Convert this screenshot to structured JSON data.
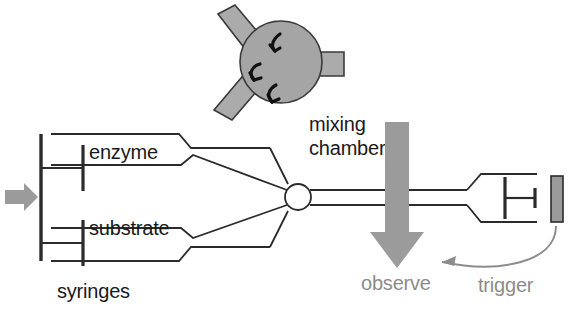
{
  "diagram": {
    "labels": {
      "enzyme": "enzyme",
      "substrate": "substrate",
      "syringes": "syringes",
      "mixing_line1": "mixing",
      "mixing_line2": "chamber",
      "observe": "observe",
      "trigger": "trigger"
    },
    "icons": {
      "drive_arrow": "drive-arrow-icon",
      "observe_arrow": "observe-arrow-icon",
      "trigger_arrow": "trigger-curved-arrow-icon",
      "swirl": "mixing-swirl-icon",
      "stop_block": "stop-block-icon"
    },
    "colors": {
      "line": "#2b2b2b",
      "gray_fill": "#9b9b9b",
      "chamber_fill": "#a5a5a5",
      "gray_text": "#8c8c8c",
      "dark_text": "#1a1a1a",
      "background": "#ffffff"
    },
    "parts": [
      {
        "name": "enzyme-syringe",
        "label": "enzyme"
      },
      {
        "name": "substrate-syringe",
        "label": "substrate"
      },
      {
        "name": "mixing-chamber",
        "label": "mixing chamber"
      },
      {
        "name": "observation-cell",
        "label": "observe"
      },
      {
        "name": "stop-syringe",
        "label": "trigger"
      }
    ]
  }
}
